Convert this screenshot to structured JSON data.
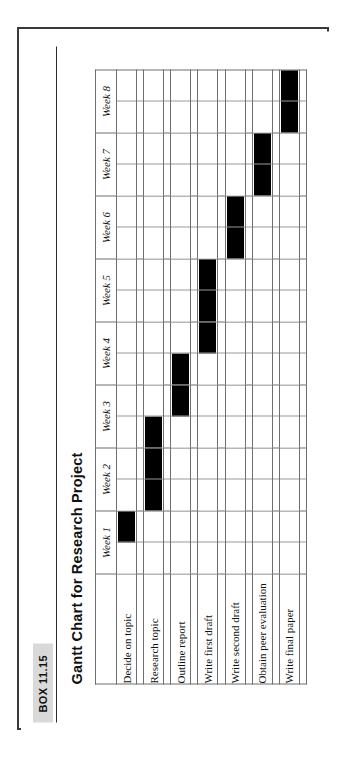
{
  "box": {
    "tag_label": "BOX 11.15"
  },
  "chart": {
    "title": "Gantt Chart for Research Project"
  },
  "colors": {
    "bar": "#000000",
    "grid": "#6f6f6f",
    "subgrid": "#9a9a9a",
    "frame": "#3a3a3a",
    "tag_background": "#d9d9d9",
    "page_background": "#ffffff"
  },
  "chart_data": {
    "type": "bar",
    "subtype": "gantt",
    "title": "Gantt Chart for Research Project",
    "xlabel": "",
    "ylabel": "",
    "grid": true,
    "legend": "none",
    "orientation": "horizontal",
    "categories": [
      "Decide on topic",
      "Research topic",
      "Outline report",
      "Write first draft",
      "Write second draft",
      "Obtain peer evaluation",
      "Write final paper"
    ],
    "x_tick_labels": [
      "Week 1",
      "Week 2",
      "Week 3",
      "Week 4",
      "Week 5",
      "Week 6",
      "Week 7",
      "Week 8"
    ],
    "xlim": [
      0,
      8
    ],
    "x_unit": "week",
    "tasks": [
      {
        "name": "Decide on topic",
        "start_week": 0.5,
        "end_week": 1.0,
        "duration_weeks": 0.5,
        "label": "Week 1"
      },
      {
        "name": "Research topic",
        "start_week": 1.0,
        "end_week": 2.5,
        "duration_weeks": 1.5,
        "label": "Week 2 to mid Week 3"
      },
      {
        "name": "Outline report",
        "start_week": 2.5,
        "end_week": 3.5,
        "duration_weeks": 1.0,
        "label": "Mid Week 3 to mid Week 4"
      },
      {
        "name": "Write first draft",
        "start_week": 3.5,
        "end_week": 5.0,
        "duration_weeks": 1.5,
        "label": "Mid Week 4 to end Week 5"
      },
      {
        "name": "Write second draft",
        "start_week": 5.0,
        "end_week": 6.0,
        "duration_weeks": 1.0,
        "label": "Week 6"
      },
      {
        "name": "Obtain peer evaluation",
        "start_week": 6.0,
        "end_week": 7.0,
        "duration_weeks": 1.0,
        "label": "Week 7"
      },
      {
        "name": "Write final paper",
        "start_week": 7.0,
        "end_week": 8.0,
        "duration_weeks": 1.0,
        "label": "Week 8"
      }
    ]
  }
}
